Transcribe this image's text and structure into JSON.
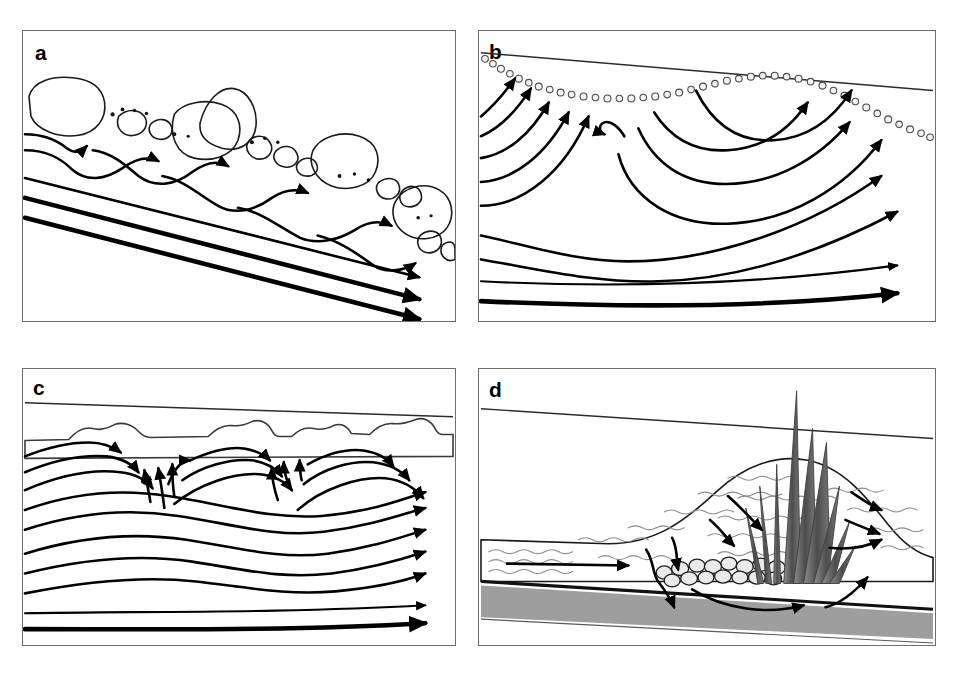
{
  "figure": {
    "type": "multi-panel-diagram",
    "panel_count": 4,
    "layout": "2x2 grid of bordered rectangular line-drawing panels on white background",
    "background_color": "#ffffff",
    "line_color": "#000000",
    "panels": [
      {
        "id": "a",
        "label": "a",
        "label_position": "top-left",
        "morphology": "steep step-pool / boulder cascade channel",
        "gradient": "steeply sloping down to the right",
        "bed_material": "large shaded boulders and cobbles with interstitial fine-sediment dots",
        "boulder_count": 6,
        "cobble_count": 12,
        "surface_flow_arrows": 5,
        "deep_flow_arrows": 3,
        "flow_direction": "left to right, downslope",
        "description": "Short shallow hyporheic flow cells plunge beneath each boulder step and re-emerge downstream; three long straight parallel deep groundwater lines run beneath, parallel to the bed slope"
      },
      {
        "id": "b",
        "label": "b",
        "label_position": "top-left",
        "morphology": "pool-riffle gravel-bed channel",
        "gradient": "low, gently sloping right",
        "bed_material": "beaded chain of small open gravel circles forming a concave pool and convex riffle",
        "surface_flow_arrows": 12,
        "flow_direction": "left to right",
        "description": "Upwelling arrows rise into the pool on the left; downwelling streamlines curve into the bed at the riffle on the right; deep nested arcs return to the channel downstream; two nearly straight deep lines at the base"
      },
      {
        "id": "c",
        "label": "c",
        "label_position": "top-left",
        "morphology": "low-gradient sand-bed channel with dunes / ripples",
        "gradient": "very low, nearly flat",
        "bed_material": "continuous gray sediment band with small irregular dune bedforms on its upper surface",
        "sediment_color": "#ababab",
        "bedform_count": 5,
        "surface_flow_arrows": 14,
        "flow_direction": "left to right",
        "description": "Repeating shallow downwelling-upwelling cells beneath each dune; tightly nested arcs of exchange under the bedforms; progressively deeper and longer flow lines below exit at the right margin; a bold basal line marks the deepest flow path"
      },
      {
        "id": "d",
        "label": "d",
        "label_position": "top-left",
        "morphology": "vegetated mid-channel bar / island with emergent macrophytes",
        "gradient": "low, gently sloping right",
        "bed_material": "wavy-textured alluvial bar over a dark gray basal confining layer, with a cluster of cobbles",
        "vegetation": "tall emergent reed blades rising above the water surface",
        "reed_count": 9,
        "cobble_count": 14,
        "basal_layer_color": "#9e9e9e",
        "surface_flow_arrows": 9,
        "flow_direction": "left to right",
        "description": "Channel water enters the alluvium from the left, flows down and through the vegetated bar around the reed root mass and cobbles, passes over the confining layer, and upwells on the downstream right side of the bar"
      }
    ]
  }
}
